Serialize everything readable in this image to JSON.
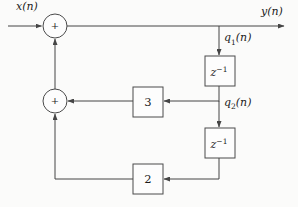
{
  "figure": {
    "background_color": "#fbfbfa",
    "line_color": "#454545",
    "text_color": "#1c1c1c",
    "input_label": "x(n)",
    "output_label": "y(n)",
    "q1_label": {
      "base": "q",
      "sub": "1",
      "suffix": "(n)"
    },
    "q2_label": {
      "base": "q",
      "sub": "2",
      "suffix": "(n)"
    },
    "adder_top_symbol": "+",
    "adder_bottom_symbol": "+",
    "delay_top": {
      "base": "z",
      "sup": "−1"
    },
    "delay_bottom": {
      "base": "z",
      "sup": "−1"
    },
    "gain_upper": "3",
    "gain_lower": "2"
  }
}
